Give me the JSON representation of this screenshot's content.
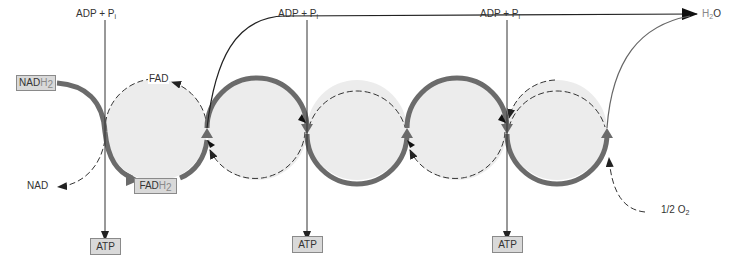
{
  "diagram": {
    "type": "electron transport chain / oxidative phosphorylation",
    "colors": {
      "circle_fill": "#ececec",
      "main_path": "#6b6b6b",
      "thin_line": "#333333",
      "box_fill": "#d9d9d9",
      "box_border": "#8a8a8a"
    },
    "inputs": {
      "nadh2": {
        "main": "NAD",
        "suffix": "H",
        "sub": "2"
      },
      "nad": "NAD",
      "fad": "FAD",
      "fadh2": {
        "main": "FAD",
        "suffix": "H",
        "sub": "2"
      },
      "oxygen": {
        "prefix": "1/2 O",
        "sub": "2"
      },
      "water": {
        "prefix": "H",
        "sub": "2",
        "suffix": "O"
      }
    },
    "phosphorylation_sites": [
      {
        "input_label": "ADP + P",
        "input_sub": "i",
        "output_label": "ATP"
      },
      {
        "input_label": "ADP + P",
        "input_sub": "i",
        "output_label": "ATP"
      },
      {
        "input_label": "ADP + P",
        "input_sub": "i",
        "output_label": "ATP"
      }
    ],
    "carrier_count": 5
  }
}
